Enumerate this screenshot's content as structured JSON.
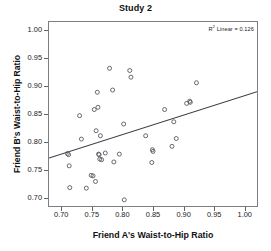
{
  "chart_data": {
    "type": "scatter",
    "title": "Study 2",
    "xlabel": "Friend A's Waist-to-Hip Ratio",
    "ylabel": "Friend B's Waist-to-Hip Ratio",
    "xlim": [
      0.68,
      1.02
    ],
    "ylim": [
      0.685,
      1.015
    ],
    "xticks": [
      "0.70",
      "0.75",
      "0.80",
      "0.85",
      "0.90",
      "0.95",
      "1.00"
    ],
    "xtick_values": [
      0.7,
      0.75,
      0.8,
      0.85,
      0.9,
      0.95,
      1.0
    ],
    "yticks": [
      "0.70",
      "0.75",
      "0.80",
      "0.85",
      "0.90",
      "0.95",
      "1.00"
    ],
    "ytick_values": [
      0.7,
      0.75,
      0.8,
      0.85,
      0.9,
      0.95,
      1.0
    ],
    "grid": false,
    "legend": "none",
    "marker": "open-circle",
    "marker_color": "#55595e",
    "annotation": "R2 Linear = 0.126",
    "annotation_prefix": "R",
    "annotation_superscript": "2",
    "annotation_suffix": " Linear = 0.126",
    "r_squared": 0.126,
    "fit_line": {
      "type": "linear",
      "color": "#3a3f45",
      "x_start": 0.68,
      "y_start": 0.771,
      "x_end": 1.02,
      "y_end": 0.89
    },
    "points": [
      [
        0.71,
        0.779
      ],
      [
        0.712,
        0.777
      ],
      [
        0.713,
        0.757
      ],
      [
        0.714,
        0.718
      ],
      [
        0.73,
        0.847
      ],
      [
        0.733,
        0.805
      ],
      [
        0.741,
        0.717
      ],
      [
        0.749,
        0.74
      ],
      [
        0.752,
        0.739
      ],
      [
        0.754,
        0.858
      ],
      [
        0.756,
        0.729
      ],
      [
        0.757,
        0.82
      ],
      [
        0.759,
        0.889
      ],
      [
        0.76,
        0.862
      ],
      [
        0.761,
        0.778
      ],
      [
        0.762,
        0.777
      ],
      [
        0.763,
        0.769
      ],
      [
        0.764,
        0.811
      ],
      [
        0.766,
        0.768
      ],
      [
        0.772,
        0.78
      ],
      [
        0.779,
        0.932
      ],
      [
        0.784,
        0.893
      ],
      [
        0.786,
        0.764
      ],
      [
        0.795,
        0.778
      ],
      [
        0.802,
        0.832
      ],
      [
        0.803,
        0.696
      ],
      [
        0.812,
        0.928
      ],
      [
        0.814,
        0.916
      ],
      [
        0.838,
        0.811
      ],
      [
        0.848,
        0.763
      ],
      [
        0.849,
        0.786
      ],
      [
        0.85,
        0.783
      ],
      [
        0.869,
        0.858
      ],
      [
        0.881,
        0.792
      ],
      [
        0.884,
        0.836
      ],
      [
        0.888,
        0.806
      ],
      [
        0.905,
        0.869
      ],
      [
        0.91,
        0.873
      ],
      [
        0.911,
        0.871
      ],
      [
        0.921,
        0.906
      ]
    ]
  }
}
